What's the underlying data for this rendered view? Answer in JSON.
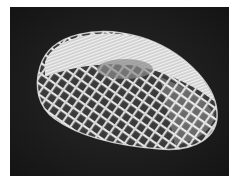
{
  "image": {
    "subject": "white lattice mesh sculpture (twisted torus form) on dark background",
    "colors": {
      "background": "#1c1c1c",
      "sculpture": "#e8e8e8",
      "shadow": "#9a9a9a",
      "border": "#ffffff"
    }
  }
}
